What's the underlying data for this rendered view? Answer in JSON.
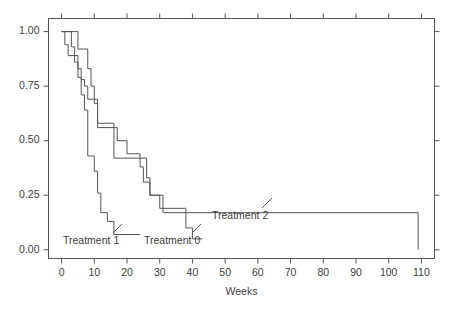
{
  "chart_data": {
    "type": "line",
    "subtype": "kaplan-meier-step",
    "title": "",
    "xlabel": "Weeks",
    "ylabel": "",
    "xlim": [
      -4,
      114
    ],
    "ylim": [
      -0.04,
      1.06
    ],
    "xticks": [
      0,
      10,
      20,
      30,
      40,
      50,
      60,
      70,
      80,
      90,
      100,
      110
    ],
    "xticklabels": [
      "0",
      "10",
      "20",
      "30",
      "40",
      "50",
      "60",
      "70",
      "80",
      "90",
      "100",
      "110"
    ],
    "yticks": [
      0.0,
      0.25,
      0.5,
      0.75,
      1.0
    ],
    "yticklabels": [
      "0.00",
      "0.25",
      "0.50",
      "0.75",
      "1.00"
    ],
    "grid": false,
    "legend_position": "inline-annotations",
    "frame": "box",
    "ticks_all_sides": true,
    "line_color": "#555555",
    "series": [
      {
        "name": "Treatment 0",
        "label": "Treatment 0",
        "x": [
          0,
          1,
          2,
          5,
          6,
          7,
          8,
          11,
          13,
          17,
          20,
          22,
          24,
          25,
          27,
          28,
          30,
          31,
          38,
          40,
          43
        ],
        "y": [
          1.0,
          0.94,
          0.89,
          0.83,
          0.78,
          0.75,
          0.69,
          0.56,
          0.56,
          0.5,
          0.44,
          0.44,
          0.38,
          0.31,
          0.25,
          0.25,
          0.19,
          0.19,
          0.1,
          0.05,
          0.05
        ],
        "step": "post",
        "end_x": 43,
        "end_y": 0.05
      },
      {
        "name": "Treatment 1",
        "label": "Treatment 1",
        "x": [
          0,
          3,
          4,
          5,
          6,
          7,
          8,
          10,
          11,
          12,
          14,
          16,
          24
        ],
        "y": [
          1.0,
          0.93,
          0.86,
          0.79,
          0.71,
          0.64,
          0.43,
          0.36,
          0.26,
          0.17,
          0.13,
          0.07,
          0.07
        ],
        "step": "post",
        "end_x": 24,
        "end_y": 0.07
      },
      {
        "name": "Treatment 2",
        "label": "Treatment 2",
        "x": [
          0,
          4,
          5,
          8,
          9,
          10,
          11,
          16,
          18,
          20,
          23,
          24,
          26,
          27,
          29,
          31,
          109
        ],
        "y": [
          1.0,
          1.0,
          0.92,
          0.83,
          0.75,
          0.67,
          0.58,
          0.42,
          0.42,
          0.42,
          0.42,
          0.42,
          0.33,
          0.25,
          0.25,
          0.17,
          0.17
        ],
        "step": "post",
        "end_x": 109,
        "end_y": 0.17,
        "terminal_drop_to": 0.0
      }
    ],
    "annotations": [
      {
        "text": "Treatment 1",
        "text_x_px": 63,
        "text_y_px": 241,
        "leader_from_px": [
          113,
          233
        ],
        "leader_to_px": [
          122,
          224
        ]
      },
      {
        "text": "Treatment 0",
        "text_x_px": 144,
        "text_y_px": 241,
        "leader_from_px": [
          192,
          233
        ],
        "leader_to_px": [
          201,
          224
        ]
      },
      {
        "text": "Treatment 2",
        "text_x_px": 212,
        "text_y_px": 216,
        "leader_from_px": [
          262,
          208
        ],
        "leader_to_px": [
          272,
          198
        ]
      }
    ]
  }
}
